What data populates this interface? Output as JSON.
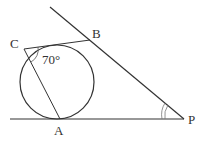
{
  "diagram": {
    "type": "geometry-tangent-circle",
    "points": {
      "A": {
        "label": "A",
        "x": 60,
        "y": 119
      },
      "B": {
        "label": "B",
        "x": 90,
        "y": 40
      },
      "C": {
        "label": "C",
        "x": 24,
        "y": 49
      },
      "P": {
        "label": "P",
        "x": 184,
        "y": 119
      }
    },
    "circle": {
      "cx": 57,
      "cy": 82,
      "r": 37
    },
    "angle_label": "70°",
    "stroke_color": "#333333"
  }
}
